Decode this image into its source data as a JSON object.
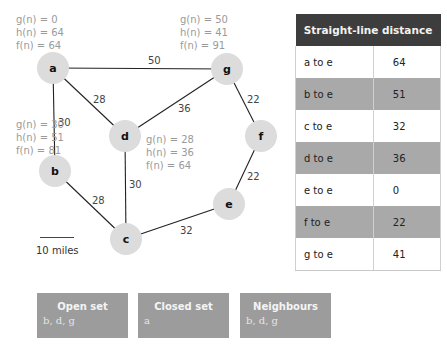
{
  "graph": {
    "nodes": [
      {
        "id": "a",
        "label": "a",
        "x": 53,
        "y": 68
      },
      {
        "id": "g",
        "label": "g",
        "x": 227,
        "y": 69
      },
      {
        "id": "d",
        "label": "d",
        "x": 125,
        "y": 136
      },
      {
        "id": "f",
        "label": "f",
        "x": 261,
        "y": 136
      },
      {
        "id": "b",
        "label": "b",
        "x": 55,
        "y": 171
      },
      {
        "id": "e",
        "label": "e",
        "x": 229,
        "y": 204
      },
      {
        "id": "c",
        "label": "c",
        "x": 126,
        "y": 239
      }
    ],
    "edges": [
      {
        "from": "a",
        "to": "g",
        "weight": "50",
        "lx": 148,
        "ly": 64
      },
      {
        "from": "a",
        "to": "d",
        "weight": "28",
        "lx": 93,
        "ly": 103
      },
      {
        "from": "a",
        "to": "b",
        "weight": "30",
        "lx": 58,
        "ly": 126
      },
      {
        "from": "g",
        "to": "d",
        "weight": "36",
        "lx": 178,
        "ly": 112
      },
      {
        "from": "g",
        "to": "f",
        "weight": "22",
        "lx": 247,
        "ly": 103
      },
      {
        "from": "d",
        "to": "c",
        "weight": "30",
        "lx": 129,
        "ly": 188
      },
      {
        "from": "b",
        "to": "c",
        "weight": "28",
        "lx": 92,
        "ly": 204
      },
      {
        "from": "f",
        "to": "e",
        "weight": "22",
        "lx": 247,
        "ly": 180
      },
      {
        "from": "c",
        "to": "e",
        "weight": "32",
        "lx": 180,
        "ly": 234
      }
    ],
    "node_color": "#dcdcdc",
    "edge_color": "#222222"
  },
  "annotations": {
    "a": {
      "g": "g(n) = 0",
      "h": "h(n) = 64",
      "f": "f(n) = 64"
    },
    "g": {
      "g": "g(n) = 50",
      "h": "h(n) = 41",
      "f": "f(n) = 91"
    },
    "b": {
      "g": "g(n) = 30",
      "h": "h(n) = 51",
      "f": "f(n) = 81"
    },
    "d": {
      "g": "g(n) = 28",
      "h": "h(n) = 36",
      "f": "f(n) = 64"
    }
  },
  "scale": {
    "label": "10 miles"
  },
  "table": {
    "title": "Straight-line distance",
    "rows": [
      {
        "from": "a to e",
        "dist": "64"
      },
      {
        "from": "b to e",
        "dist": "51"
      },
      {
        "from": "c to e",
        "dist": "32"
      },
      {
        "from": "d to e",
        "dist": "36"
      },
      {
        "from": "e to e",
        "dist": "0"
      },
      {
        "from": "f to e",
        "dist": "22"
      },
      {
        "from": "g to e",
        "dist": "41"
      }
    ]
  },
  "panels": {
    "open_set": {
      "title": "Open set",
      "value": "b, d, g"
    },
    "closed_set": {
      "title": "Closed set",
      "value": "a"
    },
    "neighbours": {
      "title": "Neighbours",
      "value": "b, d, g"
    }
  }
}
